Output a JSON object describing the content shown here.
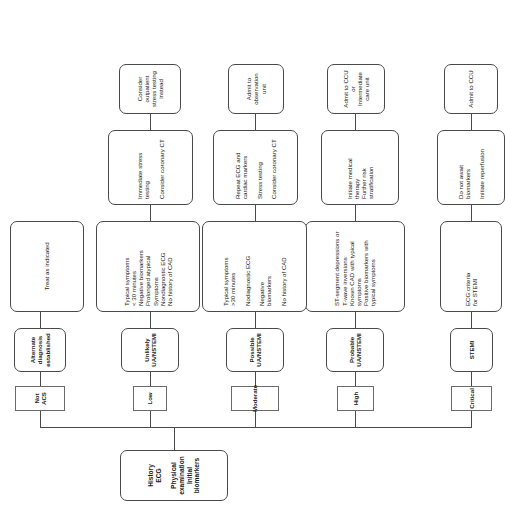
{
  "diagram": {
    "root": {
      "lines": [
        "History",
        "ECG",
        "",
        "Physical examination",
        "Initial biomarkers"
      ],
      "text": "History\nECG\n\nPhysical examination\nInitial biomarkers"
    },
    "branches": [
      {
        "risk_level": "Critical",
        "diagnosis": "STEMI",
        "criteria": "ECG criteria\nfor STEMI",
        "management": "Do not await\nbiomarkers\n\nInitiate reperfusion",
        "disposition": "Admit to CCU"
      },
      {
        "risk_level": "High",
        "diagnosis": "Probable\nUA/NSTEMI",
        "criteria": "ST-segment depressions or\nT-wave inversions\nKnown CAD with typical\nsymptoms\nPositive biomarkers with\ntypical symptoms",
        "management": "Initiate medical\ntherapy\nFurther risk\nstratification",
        "disposition": "Admit to CCU\nor\nIntermediate\ncare unit"
      },
      {
        "risk_level": "Moderate",
        "diagnosis": "Possible\nUA/NSTEMI",
        "criteria": "Typical symptoms\n>30 minutes\n\nNodiagnostic ECG\n\nNegative\nbiomarkers\n\nNo history of CAD",
        "management": "Repeat ECG and\ncardiac markers\n\nStress testing\n\nConsider coronary CT",
        "disposition": "Admit to\nobservation\nunit"
      },
      {
        "risk_level": "Low",
        "diagnosis": "Unlikely\nUA/NSTEMI",
        "criteria": "Typical symptoms\n< 30 minutes\nNegative biomarkers\nProlonged atypical\nSymptoms\nNondiagnostic ECG\nNo history of CAD",
        "management": "Immediate stress\ntesting\n\nConsider coronary CT",
        "disposition": "Consider\noutpatient\nstress testing\ninstead"
      },
      {
        "risk_level": "Not ACS",
        "diagnosis": "Alternate\ndiagnosis\nestablished",
        "criteria": "Treat as indicated",
        "management": "",
        "disposition": ""
      }
    ]
  }
}
